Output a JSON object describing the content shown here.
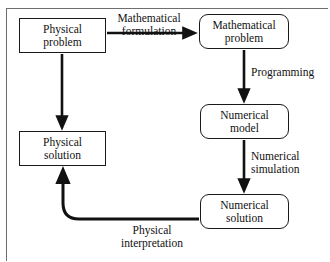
{
  "diagram": {
    "type": "flowchart",
    "background_color": "#ffffff",
    "line_color": "#111111",
    "frame_color": "#6e6e6e",
    "nodes": [
      {
        "id": "physical-problem",
        "label": "Physical\nproblem",
        "shape": "rectangle",
        "x": 19,
        "y": 18,
        "w": 87,
        "h": 35
      },
      {
        "id": "mathematical-problem",
        "label": "Mathematical\nproblem",
        "shape": "rounded-rectangle",
        "x": 199,
        "y": 14,
        "w": 90,
        "h": 35
      },
      {
        "id": "numerical-model",
        "label": "Numerical\nmodel",
        "shape": "rounded-rectangle",
        "x": 200,
        "y": 104,
        "w": 89,
        "h": 35
      },
      {
        "id": "numerical-solution",
        "label": "Numerical\nsolution",
        "shape": "rounded-rectangle",
        "x": 200,
        "y": 194,
        "w": 89,
        "h": 35
      },
      {
        "id": "physical-solution",
        "label": "Physical\nsolution",
        "shape": "rectangle",
        "x": 19,
        "y": 131,
        "w": 87,
        "h": 35
      }
    ],
    "edges": [
      {
        "id": "mathematical-formulation",
        "from": "physical-problem",
        "to": "mathematical-problem",
        "label": "Mathematical\nformulation",
        "direction": "right"
      },
      {
        "id": "programming",
        "from": "mathematical-problem",
        "to": "numerical-model",
        "label": "Programming",
        "direction": "down"
      },
      {
        "id": "numerical-simulation",
        "from": "numerical-model",
        "to": "numerical-solution",
        "label": "Numerical\nsimulation",
        "direction": "down"
      },
      {
        "id": "physical-interpretation",
        "from": "numerical-solution",
        "to": "physical-solution",
        "label": "Physical\ninterpretation",
        "direction": "left-up-curved"
      },
      {
        "id": "physical-problem-to-solution",
        "from": "physical-problem",
        "to": "physical-solution",
        "label": "",
        "direction": "down"
      }
    ]
  }
}
